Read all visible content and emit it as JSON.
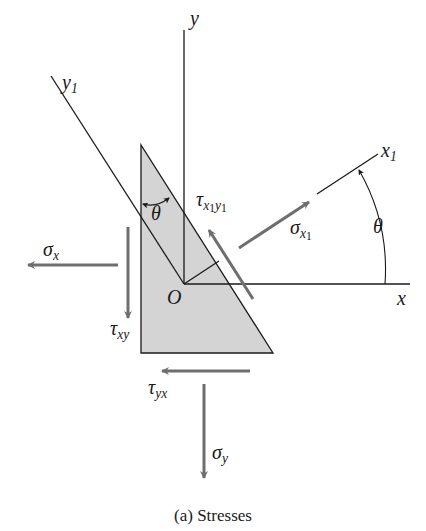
{
  "figure": {
    "caption": "(a) Stresses",
    "colors": {
      "background": "#ffffff",
      "element_fill": "#d4d4d4",
      "lines": "#1a1a1a",
      "arrows": "#6e6e6e"
    }
  },
  "axes": {
    "x": {
      "label": "x"
    },
    "y": {
      "label": "y"
    },
    "x1": {
      "label": "x",
      "sub": "1"
    },
    "y1": {
      "label": "y",
      "sub": "1"
    },
    "origin": {
      "label": "O"
    }
  },
  "angles": {
    "theta_element": "θ",
    "theta_axes": "θ"
  },
  "stresses": {
    "sigma_x": {
      "symbol": "σ",
      "sub": "x"
    },
    "sigma_y": {
      "symbol": "σ",
      "sub": "y"
    },
    "tau_xy": {
      "symbol": "τ",
      "sub": "xy"
    },
    "tau_yx": {
      "symbol": "τ",
      "sub": "yx"
    },
    "sigma_x1": {
      "symbol": "σ",
      "sub": "x",
      "subsub": "1"
    },
    "tau_x1y1": {
      "symbol": "τ",
      "sub_a": "x",
      "sub_a_idx": "1",
      "sub_b": "y",
      "sub_b_idx": "1"
    }
  }
}
